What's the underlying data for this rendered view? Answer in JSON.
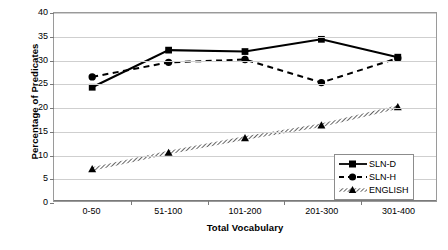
{
  "chart_data": {
    "type": "line",
    "title": "",
    "xlabel": "Total Vocabulary",
    "ylabel": "Percentage of Predicates",
    "categories": [
      "0-50",
      "51-100",
      "101-200",
      "201-300",
      "301-400"
    ],
    "ylim": [
      0,
      40
    ],
    "ytick_values": [
      0,
      5,
      10,
      15,
      20,
      25,
      30,
      35,
      40
    ],
    "ytick_labels": [
      "0",
      "5",
      "10",
      "15",
      "20",
      "25",
      "30",
      "35",
      "40"
    ],
    "grid": true,
    "legend_position": "lower-right-inside",
    "series": [
      {
        "name": "SLN-D",
        "values": [
          24.2,
          32.1,
          31.8,
          34.4,
          30.6
        ],
        "line_style": "solid",
        "marker": "square",
        "color": "#000000"
      },
      {
        "name": "SLN-H",
        "values": [
          26.4,
          29.5,
          30.1,
          25.2,
          30.4
        ],
        "line_style": "dashed",
        "marker": "circle",
        "color": "#000000"
      },
      {
        "name": "ENGLISH",
        "values": [
          6.8,
          10.3,
          13.4,
          16.1,
          20.0
        ],
        "line_style": "hatched",
        "marker": "triangle",
        "color": "#000000"
      }
    ]
  },
  "axes": {
    "y_title": "Percentage of Predicates",
    "x_title": "Total Vocabulary"
  },
  "legend": {
    "items": [
      {
        "label": "SLN-D",
        "key": "solid-square-key"
      },
      {
        "label": "SLN-H",
        "key": "dashed-circle-key"
      },
      {
        "label": "ENGLISH",
        "key": "hatched-triangle-key"
      }
    ]
  },
  "colors": {
    "series": "#000000",
    "gridline": "#cfcfcf",
    "axis": "#7a7a7a",
    "plot_border": "#9a9a9a",
    "background": "#ffffff"
  }
}
